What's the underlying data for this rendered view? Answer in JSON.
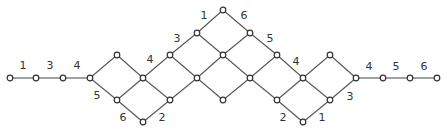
{
  "diagram": {
    "type": "graph",
    "nodes": [
      {
        "id": "a1",
        "x": 10,
        "y": 78
      },
      {
        "id": "a2",
        "x": 36,
        "y": 78
      },
      {
        "id": "a3",
        "x": 63,
        "y": 78
      },
      {
        "id": "a4",
        "x": 90,
        "y": 78
      },
      {
        "id": "n1",
        "x": 117,
        "y": 55
      },
      {
        "id": "n2",
        "x": 117,
        "y": 100
      },
      {
        "id": "n3",
        "x": 143,
        "y": 78
      },
      {
        "id": "n4",
        "x": 143,
        "y": 122
      },
      {
        "id": "n5",
        "x": 170,
        "y": 55
      },
      {
        "id": "n6",
        "x": 170,
        "y": 100
      },
      {
        "id": "n7",
        "x": 197,
        "y": 33
      },
      {
        "id": "n8",
        "x": 197,
        "y": 78
      },
      {
        "id": "n9",
        "x": 223,
        "y": 10
      },
      {
        "id": "n10",
        "x": 223,
        "y": 55
      },
      {
        "id": "n11",
        "x": 223,
        "y": 100
      },
      {
        "id": "n12",
        "x": 250,
        "y": 33
      },
      {
        "id": "n13",
        "x": 250,
        "y": 78
      },
      {
        "id": "n14",
        "x": 277,
        "y": 55
      },
      {
        "id": "n15",
        "x": 277,
        "y": 100
      },
      {
        "id": "n16",
        "x": 303,
        "y": 78
      },
      {
        "id": "n17",
        "x": 303,
        "y": 122
      },
      {
        "id": "n18",
        "x": 330,
        "y": 55
      },
      {
        "id": "n19",
        "x": 330,
        "y": 100
      },
      {
        "id": "b1",
        "x": 356,
        "y": 78
      },
      {
        "id": "b2",
        "x": 383,
        "y": 78
      },
      {
        "id": "b3",
        "x": 410,
        "y": 78
      },
      {
        "id": "b4",
        "x": 437,
        "y": 78
      }
    ],
    "edges": [
      [
        "a1",
        "a2"
      ],
      [
        "a2",
        "a3"
      ],
      [
        "a3",
        "a4"
      ],
      [
        "a4",
        "n1"
      ],
      [
        "a4",
        "n2"
      ],
      [
        "n1",
        "n3"
      ],
      [
        "n2",
        "n3"
      ],
      [
        "n2",
        "n4"
      ],
      [
        "n3",
        "n5"
      ],
      [
        "n3",
        "n6"
      ],
      [
        "n4",
        "n6"
      ],
      [
        "n5",
        "n7"
      ],
      [
        "n5",
        "n8"
      ],
      [
        "n6",
        "n8"
      ],
      [
        "n7",
        "n9"
      ],
      [
        "n7",
        "n10"
      ],
      [
        "n8",
        "n10"
      ],
      [
        "n8",
        "n11"
      ],
      [
        "n9",
        "n12"
      ],
      [
        "n10",
        "n12"
      ],
      [
        "n10",
        "n13"
      ],
      [
        "n11",
        "n13"
      ],
      [
        "n12",
        "n14"
      ],
      [
        "n13",
        "n14"
      ],
      [
        "n13",
        "n15"
      ],
      [
        "n14",
        "n16"
      ],
      [
        "n15",
        "n16"
      ],
      [
        "n15",
        "n17"
      ],
      [
        "n16",
        "n18"
      ],
      [
        "n16",
        "n19"
      ],
      [
        "n17",
        "n19"
      ],
      [
        "n18",
        "b1"
      ],
      [
        "n19",
        "b1"
      ],
      [
        "b1",
        "b2"
      ],
      [
        "b2",
        "b3"
      ],
      [
        "b3",
        "b4"
      ]
    ],
    "labels": [
      {
        "text": "1",
        "x": 23,
        "y": 69
      },
      {
        "text": "3",
        "x": 50,
        "y": 69
      },
      {
        "text": "4",
        "x": 77,
        "y": 69
      },
      {
        "text": "5",
        "x": 97,
        "y": 99
      },
      {
        "text": "6",
        "x": 123,
        "y": 121
      },
      {
        "text": "2",
        "x": 162,
        "y": 121
      },
      {
        "text": "4",
        "x": 150,
        "y": 63
      },
      {
        "text": "3",
        "x": 177,
        "y": 42
      },
      {
        "text": "1",
        "x": 204,
        "y": 19
      },
      {
        "text": "6",
        "x": 244,
        "y": 19
      },
      {
        "text": "5",
        "x": 270,
        "y": 42
      },
      {
        "text": "4",
        "x": 296,
        "y": 65
      },
      {
        "text": "2",
        "x": 283,
        "y": 121
      },
      {
        "text": "1",
        "x": 322,
        "y": 121
      },
      {
        "text": "3",
        "x": 350,
        "y": 100
      },
      {
        "text": "4",
        "x": 369,
        "y": 70
      },
      {
        "text": "5",
        "x": 396,
        "y": 70
      },
      {
        "text": "6",
        "x": 424,
        "y": 70
      }
    ]
  }
}
